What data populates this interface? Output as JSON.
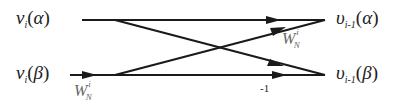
{
  "diagram": {
    "type": "butterfly",
    "inputs": [
      {
        "symbol": "ν",
        "sub": "i",
        "arg": "α"
      },
      {
        "symbol": "ν",
        "sub": "i",
        "arg": "β"
      }
    ],
    "outputs": [
      {
        "symbol": "υ",
        "sub": "i-1",
        "arg": "α"
      },
      {
        "symbol": "υ",
        "sub": "i-1",
        "arg": "β"
      }
    ],
    "edge_labels": {
      "input_beta_weight": {
        "base": "W",
        "sup": "i",
        "sub": "N"
      },
      "cross_up_weight": {
        "base": "W",
        "sup": "i",
        "sub": "N"
      },
      "bottom_straight": "-1"
    },
    "colors": {
      "line": "#1a1a1a",
      "weight_label": "#666666"
    }
  }
}
